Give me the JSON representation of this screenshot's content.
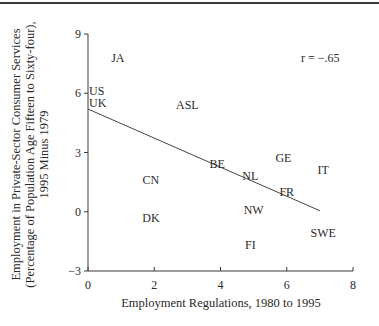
{
  "chart_data": {
    "type": "scatter",
    "title": "",
    "xlabel": "Employment Regulations, 1980 to 1995",
    "ylabel_lines": [
      "Employment in Private-Sector Consumer Services",
      "(Percentage of Population Age Fifteen to Sixty-four),",
      "1995 Minus 1979"
    ],
    "xlim": [
      0,
      8
    ],
    "ylim": [
      -3,
      9
    ],
    "x_ticks": [
      0,
      2,
      4,
      6,
      8
    ],
    "y_ticks": [
      -3,
      0,
      3,
      6,
      9
    ],
    "grid": false,
    "annotation": "r = −.65",
    "points": [
      {
        "label": "JA",
        "x": 0.9,
        "y": 7.8
      },
      {
        "label": "US",
        "x": 0.3,
        "y": 6.1
      },
      {
        "label": "UK",
        "x": 0.3,
        "y": 5.5
      },
      {
        "label": "ASL",
        "x": 3.0,
        "y": 5.4
      },
      {
        "label": "BE",
        "x": 3.9,
        "y": 2.4
      },
      {
        "label": "GE",
        "x": 5.9,
        "y": 2.7
      },
      {
        "label": "IT",
        "x": 7.1,
        "y": 2.1
      },
      {
        "label": "NL",
        "x": 4.9,
        "y": 1.8
      },
      {
        "label": "CN",
        "x": 1.9,
        "y": 1.6
      },
      {
        "label": "FR",
        "x": 6.0,
        "y": 1.0
      },
      {
        "label": "NW",
        "x": 5.0,
        "y": 0.1
      },
      {
        "label": "DK",
        "x": 1.9,
        "y": -0.3
      },
      {
        "label": "SWE",
        "x": 7.1,
        "y": -1.1
      },
      {
        "label": "FI",
        "x": 4.9,
        "y": -1.7
      }
    ],
    "regression_line": {
      "x0": 0,
      "y0": 5.2,
      "x1": 7.0,
      "y1": 0.05
    }
  }
}
